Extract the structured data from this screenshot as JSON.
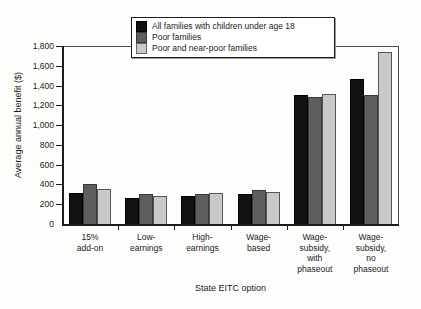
{
  "chart_data": {
    "type": "bar",
    "title": "",
    "xlabel": "State EITC option",
    "ylabel": "Average annual benefit ($)",
    "ylim": [
      0,
      1800
    ],
    "ytick_step": 200,
    "ytick_labels": [
      "1,800",
      "1,600",
      "1,400",
      "1,200",
      "1,000",
      "800",
      "600",
      "400",
      "200",
      "0"
    ],
    "ytick_values": [
      1800,
      1600,
      1400,
      1200,
      1000,
      800,
      600,
      400,
      200,
      0
    ],
    "grid": false,
    "legend_position": "top-center",
    "categories": [
      "15%\nadd-on",
      "Low-\nearnings",
      "High-\nearnings",
      "Wage-\nbased",
      "Wage-\nsubsidy,\nwith\nphaseout",
      "Wage-\nsubsidy,\nno\nphaseout"
    ],
    "series": [
      {
        "name": "All families with children under age 18",
        "color": "#111111",
        "values": [
          310,
          265,
          285,
          305,
          1300,
          1470
        ]
      },
      {
        "name": "Poor families",
        "color": "#5e5e5e",
        "values": [
          400,
          305,
          300,
          340,
          1280,
          1300
        ]
      },
      {
        "name": "Poor and near-poor families",
        "color": "#c9c9c9",
        "values": [
          350,
          280,
          310,
          325,
          1310,
          1740
        ]
      }
    ]
  }
}
